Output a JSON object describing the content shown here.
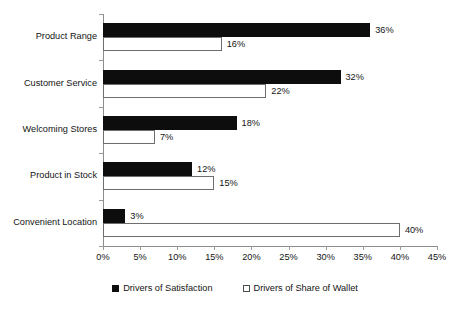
{
  "chart_data": {
    "type": "bar",
    "orientation": "horizontal",
    "title": "",
    "subtitle": "",
    "xlabel": "",
    "ylabel": "",
    "categories": [
      "Product Range",
      "Customer Service",
      "Welcoming Stores",
      "Product in Stock",
      "Convenient Location"
    ],
    "series": [
      {
        "name": "Drivers of Satisfaction",
        "values": [
          36,
          32,
          18,
          12,
          3
        ],
        "labels": [
          "36%",
          "32%",
          "18%",
          "12%",
          "3%"
        ],
        "color": "#0d0d0d",
        "fill": "solid-black"
      },
      {
        "name": "Drivers of Share of Wallet",
        "values": [
          16,
          22,
          7,
          15,
          40
        ],
        "labels": [
          "16%",
          "22%",
          "7%",
          "15%",
          "40%"
        ],
        "color": "#ffffff",
        "fill": "white-outline"
      }
    ],
    "xlim": [
      0,
      45
    ],
    "xtick_values": [
      0,
      5,
      10,
      15,
      20,
      25,
      30,
      35,
      40,
      45
    ],
    "xtick_labels": [
      "0%",
      "5%",
      "10%",
      "15%",
      "20%",
      "25%",
      "30%",
      "35%",
      "40%",
      "45%"
    ],
    "grid": false,
    "legend_position": "bottom",
    "background": "#ffffff",
    "axis_color": "#8c8c8c"
  },
  "legend": {
    "items": [
      {
        "label": "Drivers of Satisfaction"
      },
      {
        "label": "Drivers of Share of Wallet"
      }
    ]
  }
}
